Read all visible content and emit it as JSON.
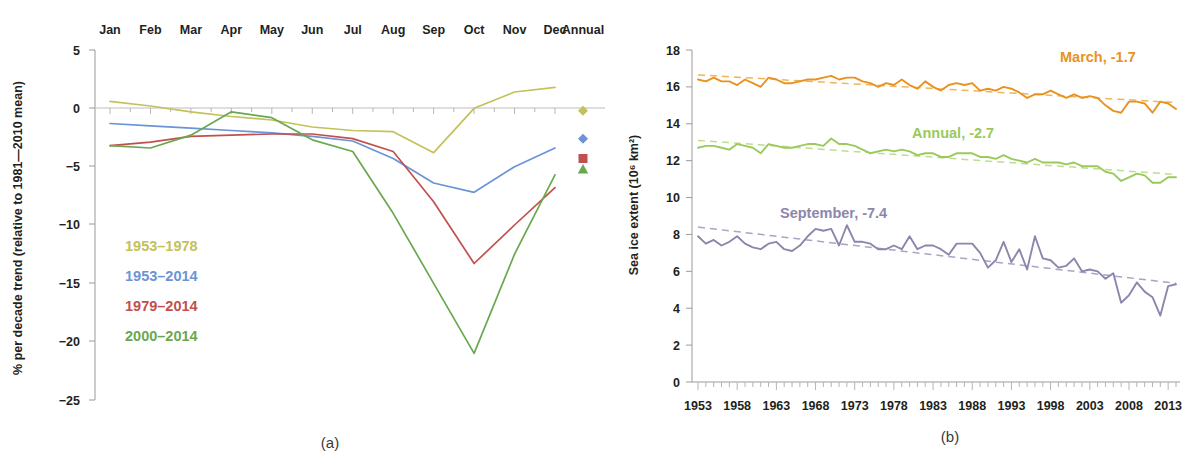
{
  "figure": {
    "panel_a_caption": "(a)",
    "panel_b_caption": "(b)"
  },
  "panel_a": {
    "ylabel": "% per decade trend (relative to 1981—2010 mean)",
    "yticks": [
      "5",
      "0",
      "−5",
      "−10",
      "−15",
      "−20",
      "−25"
    ],
    "xticks": [
      "Jan",
      "Feb",
      "Mar",
      "Apr",
      "May",
      "Jun",
      "Jul",
      "Aug",
      "Sep",
      "Oct",
      "Nov",
      "Dec",
      "Annual"
    ],
    "legend": [
      {
        "label": "1953–1978",
        "color": "#c3c15a",
        "bold": false
      },
      {
        "label": "1953–2014",
        "color": "#6b93d6",
        "bold": false
      },
      {
        "label": "1979–2014",
        "color": "#c0504d",
        "bold": true
      },
      {
        "label": "2000–2014",
        "color": "#6aa84f",
        "bold": false
      }
    ]
  },
  "panel_b": {
    "ylabel": "Sea ice extent (10⁶ km²)",
    "yticks": [
      "18",
      "16",
      "14",
      "12",
      "10",
      "8",
      "6",
      "4",
      "2",
      "0"
    ],
    "xticks": [
      "1953",
      "1958",
      "1963",
      "1968",
      "1973",
      "1978",
      "1983",
      "1988",
      "1993",
      "1998",
      "2003",
      "2008",
      "2013"
    ],
    "annotations": [
      {
        "label": "March, -1.7",
        "color": "#e8921f"
      },
      {
        "label": "Annual, -2.7",
        "color": "#9bc95a"
      },
      {
        "label": "September, -7.4",
        "color": "#8b86ac"
      }
    ]
  },
  "chart_data": [
    {
      "type": "line",
      "title": "(a) Arctic sea ice extent trend by month",
      "xlabel": "",
      "ylabel": "% per decade trend (relative to 1981—2010 mean)",
      "categories": [
        "Jan",
        "Feb",
        "Mar",
        "Apr",
        "May",
        "Jun",
        "Jul",
        "Aug",
        "Sep",
        "Oct",
        "Nov",
        "Dec",
        "Annual"
      ],
      "ylim": [
        -25,
        5
      ],
      "xtick_labels": [
        "Jan",
        "Feb",
        "Mar",
        "Apr",
        "May",
        "Jun",
        "Jul",
        "Aug",
        "Sep",
        "Oct",
        "Nov",
        "Dec",
        "Annual"
      ],
      "ytick_labels": [
        "5",
        "0",
        "-5",
        "-10",
        "-15",
        "-20",
        "-25"
      ],
      "grid": false,
      "legend_position": "inside-lower-left",
      "series": [
        {
          "name": "1953–1978",
          "color": "#c3c15a",
          "values": [
            0.6,
            0.2,
            -0.3,
            -0.7,
            -1.0,
            -1.6,
            -1.9,
            -2.0,
            -3.8,
            0.0,
            1.4,
            1.8,
            1.1
          ],
          "annual": -0.2,
          "marker": "diamond"
        },
        {
          "name": "1953–2014",
          "color": "#6b93d6",
          "values": [
            -1.3,
            -1.5,
            -1.7,
            -1.9,
            -2.1,
            -2.4,
            -2.8,
            -4.3,
            -6.4,
            -7.2,
            -5.0,
            -3.4,
            -2.1
          ],
          "annual": -2.6,
          "marker": "diamond"
        },
        {
          "name": "1979–2014",
          "color": "#c0504d",
          "values": [
            -3.2,
            -2.9,
            -2.4,
            -2.3,
            -2.2,
            -2.2,
            -2.6,
            -3.7,
            -8.0,
            -13.3,
            -10.0,
            -6.8,
            -4.5
          ],
          "annual": -4.3,
          "marker": "square"
        },
        {
          "name": "2000–2014",
          "color": "#6aa84f",
          "values": [
            -3.2,
            -3.4,
            -2.3,
            -0.3,
            -0.8,
            -2.7,
            -3.7,
            -9.0,
            -15.0,
            -21.0,
            -12.5,
            -5.7,
            -4.5
          ],
          "annual": -5.2,
          "marker": "triangle"
        }
      ]
    },
    {
      "type": "line",
      "title": "(b) Sea ice extent time series 1953–2014",
      "xlabel": "",
      "ylabel": "Sea ice extent (10⁶ km²)",
      "ylim": [
        0,
        18
      ],
      "xlim": [
        1953,
        2014
      ],
      "xtick_labels": [
        "1953",
        "1958",
        "1963",
        "1968",
        "1973",
        "1978",
        "1983",
        "1988",
        "1993",
        "1998",
        "2003",
        "2008",
        "2013"
      ],
      "ytick_labels": [
        "0",
        "2",
        "4",
        "6",
        "8",
        "10",
        "12",
        "14",
        "16",
        "18"
      ],
      "grid": false,
      "legend_position": "inline-annotations",
      "x": [
        1953,
        1954,
        1955,
        1956,
        1957,
        1958,
        1959,
        1960,
        1961,
        1962,
        1963,
        1964,
        1965,
        1966,
        1967,
        1968,
        1969,
        1970,
        1971,
        1972,
        1973,
        1974,
        1975,
        1976,
        1977,
        1978,
        1979,
        1980,
        1981,
        1982,
        1983,
        1984,
        1985,
        1986,
        1987,
        1988,
        1989,
        1990,
        1991,
        1992,
        1993,
        1994,
        1995,
        1996,
        1997,
        1998,
        1999,
        2000,
        2001,
        2002,
        2003,
        2004,
        2005,
        2006,
        2007,
        2008,
        2009,
        2010,
        2011,
        2012,
        2013,
        2014
      ],
      "series": [
        {
          "name": "March",
          "annotation": "March, -1.7",
          "trend_per_decade": -1.7,
          "color": "#e8921f",
          "trend_color": "#f0b45c",
          "values": [
            16.4,
            16.3,
            16.5,
            16.3,
            16.3,
            16.1,
            16.4,
            16.2,
            16.0,
            16.5,
            16.4,
            16.2,
            16.2,
            16.3,
            16.4,
            16.4,
            16.5,
            16.6,
            16.4,
            16.5,
            16.5,
            16.3,
            16.2,
            16.0,
            16.2,
            16.1,
            16.4,
            16.1,
            15.9,
            16.3,
            16.0,
            15.8,
            16.1,
            16.2,
            16.1,
            16.2,
            15.8,
            15.9,
            15.8,
            16.0,
            15.9,
            15.7,
            15.4,
            15.6,
            15.6,
            15.8,
            15.6,
            15.4,
            15.6,
            15.4,
            15.5,
            15.4,
            15.0,
            14.7,
            14.6,
            15.2,
            15.2,
            15.1,
            14.6,
            15.2,
            15.1,
            14.8
          ],
          "trend_start": 16.65,
          "trend_end": 15.15
        },
        {
          "name": "Annual",
          "annotation": "Annual, -2.7",
          "trend_per_decade": -2.7,
          "color": "#9bc95a",
          "trend_color": "#bdde8f",
          "values": [
            12.7,
            12.8,
            12.8,
            12.7,
            12.6,
            12.9,
            12.8,
            12.7,
            12.4,
            12.9,
            12.8,
            12.7,
            12.7,
            12.8,
            12.9,
            12.9,
            12.8,
            13.2,
            12.9,
            12.9,
            12.8,
            12.6,
            12.4,
            12.5,
            12.6,
            12.5,
            12.6,
            12.5,
            12.3,
            12.4,
            12.4,
            12.2,
            12.2,
            12.4,
            12.4,
            12.4,
            12.2,
            12.2,
            12.1,
            12.3,
            12.1,
            12.0,
            11.9,
            12.1,
            11.9,
            11.9,
            11.9,
            11.8,
            11.9,
            11.7,
            11.7,
            11.7,
            11.4,
            11.3,
            10.9,
            11.1,
            11.3,
            11.2,
            10.8,
            10.8,
            11.1,
            11.1
          ],
          "trend_start": 13.1,
          "trend_end": 11.25
        },
        {
          "name": "September",
          "annotation": "September, -7.4",
          "trend_per_decade": -7.4,
          "color": "#8b86ac",
          "trend_color": "#a9a4c4",
          "values": [
            7.9,
            7.5,
            7.7,
            7.4,
            7.6,
            7.9,
            7.5,
            7.3,
            7.2,
            7.5,
            7.6,
            7.2,
            7.1,
            7.4,
            7.9,
            8.3,
            8.2,
            8.3,
            7.4,
            8.5,
            7.6,
            7.6,
            7.5,
            7.2,
            7.2,
            7.4,
            7.2,
            7.9,
            7.2,
            7.4,
            7.4,
            7.2,
            6.9,
            7.5,
            7.5,
            7.5,
            7.0,
            6.2,
            6.6,
            7.6,
            6.5,
            7.2,
            6.1,
            7.9,
            6.7,
            6.6,
            6.2,
            6.3,
            6.7,
            6.0,
            6.1,
            6.0,
            5.6,
            5.9,
            4.3,
            4.7,
            5.4,
            4.9,
            4.6,
            3.6,
            5.2,
            5.3
          ],
          "trend_start": 8.4,
          "trend_end": 5.35
        }
      ]
    }
  ]
}
